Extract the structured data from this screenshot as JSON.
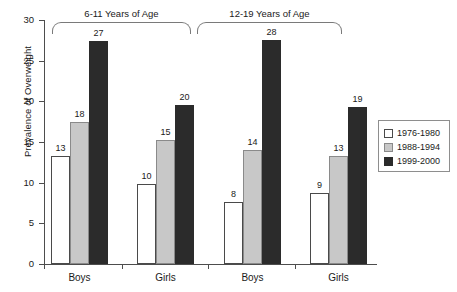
{
  "chart_data": {
    "type": "bar",
    "title": "",
    "xlabel": "",
    "ylabel": "Prevalence of Overweight",
    "ylim": [
      0,
      30
    ],
    "yticks": [
      0,
      5,
      10,
      15,
      20,
      25,
      30
    ],
    "grid": false,
    "legend_position": "right",
    "categories": [
      "Boys",
      "Girls",
      "Boys",
      "Girls"
    ],
    "groups": [
      {
        "label": "6-11 Years of Age",
        "categories": [
          "Boys",
          "Girls"
        ]
      },
      {
        "label": "12-19 Years of Age",
        "categories": [
          "Boys",
          "Girls"
        ]
      }
    ],
    "series": [
      {
        "name": "1976-1980",
        "color": "#ffffff",
        "values": [
          13,
          10,
          8,
          9
        ],
        "plotted": [
          13.3,
          9.8,
          7.6,
          8.7
        ]
      },
      {
        "name": "1988-1994",
        "color": "#c8c8c8",
        "values": [
          18,
          15,
          14,
          13
        ],
        "plotted": [
          17.5,
          15.2,
          14.0,
          13.3
        ]
      },
      {
        "name": "1999-2000",
        "color": "#2b2b2b",
        "values": [
          27,
          20,
          28,
          19
        ],
        "plotted": [
          27.4,
          19.6,
          27.6,
          19.3
        ]
      }
    ],
    "bar_labels": [
      [
        "13",
        "10",
        "8",
        "9"
      ],
      [
        "18",
        "15",
        "14",
        "13"
      ],
      [
        "27",
        "20",
        "28",
        "19"
      ]
    ]
  },
  "legend": {
    "items": [
      {
        "label": "1976-1980",
        "swatch": "white-square-icon"
      },
      {
        "label": "1988-1994",
        "swatch": "gray-square-icon"
      },
      {
        "label": "1999-2000",
        "swatch": "black-square-icon"
      }
    ]
  },
  "axis": {
    "y_title": "Prevalence of Overweight",
    "y_tick_labels": [
      "30",
      "25",
      "20",
      "15",
      "10",
      "5",
      "0"
    ]
  },
  "colors": {
    "series_1976_1980": "#ffffff",
    "series_1988_1994": "#c8c8c8",
    "series_1999_2000": "#2b2b2b",
    "axis": "#4d4d4d",
    "text": "#1a1a1a",
    "background": "#ffffff"
  }
}
